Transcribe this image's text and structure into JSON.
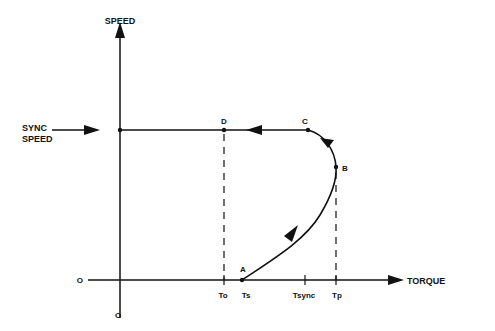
{
  "diagram": {
    "type": "speed-torque curve",
    "axes": {
      "y_label": "SPEED",
      "x_label": "TORQUE",
      "origin_x_label": "O",
      "origin_y_label": "O"
    },
    "sync_speed_label_line1": "SYNC",
    "sync_speed_label_line2": "SPEED",
    "points": {
      "A": "A",
      "B": "B",
      "C": "C",
      "D": "D"
    },
    "x_ticks": {
      "to": "To",
      "ts": "Ts",
      "tsync": "Tsync",
      "tp": "Tp"
    },
    "colors": {
      "line": "#111111",
      "background": "#ffffff"
    }
  }
}
